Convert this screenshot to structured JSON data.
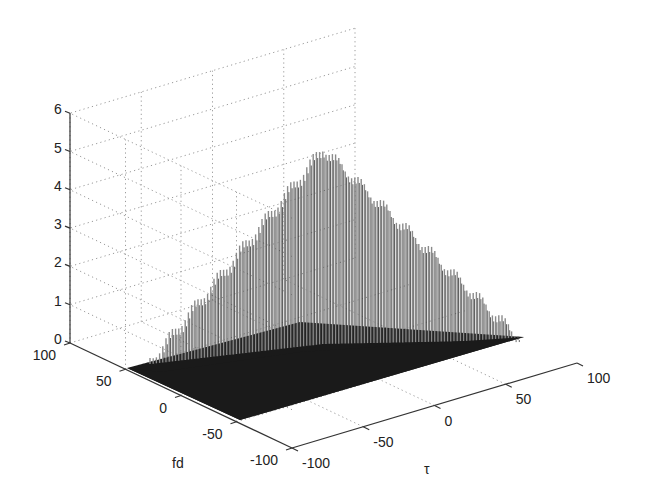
{
  "chart_data": {
    "type": "surface3d",
    "title": "",
    "xlabel": "τ",
    "ylabel": "fd",
    "zlabel": "",
    "x_ticks": [
      "-100",
      "-50",
      "0",
      "50",
      "100"
    ],
    "y_ticks": [
      "100",
      "50",
      "0",
      "-50",
      "-100"
    ],
    "z_ticks": [
      "0",
      "1",
      "2",
      "3",
      "4",
      "5",
      "6"
    ],
    "xlim": [
      -100,
      100
    ],
    "ylim": [
      -100,
      100
    ],
    "zlim": [
      0,
      6
    ],
    "grid": true,
    "peak": {
      "x": 0,
      "y": 0,
      "z": 5.2
    },
    "envelope_profile": {
      "x": [
        -100,
        -75,
        -50,
        -25,
        0,
        25,
        50,
        75,
        100
      ],
      "z_max": [
        0,
        0.6,
        1.5,
        3.0,
        5.2,
        3.0,
        1.5,
        0.6,
        0
      ]
    },
    "surface_color": "#1a1a1a",
    "spike_color": "#8a8a8a"
  },
  "labels": {
    "x": "τ",
    "y": "fd"
  }
}
